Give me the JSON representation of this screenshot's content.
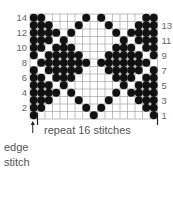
{
  "chart_data": {
    "type": "heatmap",
    "columns": 17,
    "rows": 14,
    "edge_stitch_columns": [
      1
    ],
    "repeat_stitches": 16,
    "cell_meaning": {
      "1": "contrast color (dot)",
      "0": "main color (empty)"
    },
    "grid_rows_top_to_bottom": [
      {
        "row": 14,
        "cells": [
          1,
          1,
          0,
          0,
          0,
          0,
          0,
          1,
          0,
          1,
          0,
          0,
          0,
          0,
          0,
          1,
          1
        ]
      },
      {
        "row": 13,
        "cells": [
          1,
          1,
          1,
          0,
          0,
          0,
          1,
          0,
          0,
          0,
          1,
          0,
          0,
          0,
          1,
          1,
          1
        ]
      },
      {
        "row": 12,
        "cells": [
          1,
          1,
          1,
          1,
          0,
          1,
          0,
          0,
          0,
          0,
          0,
          1,
          0,
          1,
          1,
          1,
          1
        ]
      },
      {
        "row": 11,
        "cells": [
          1,
          1,
          1,
          0,
          1,
          0,
          0,
          0,
          0,
          0,
          0,
          0,
          1,
          0,
          1,
          1,
          1
        ]
      },
      {
        "row": 10,
        "cells": [
          1,
          1,
          0,
          1,
          1,
          1,
          0,
          0,
          0,
          0,
          0,
          1,
          1,
          1,
          0,
          1,
          1
        ]
      },
      {
        "row": 9,
        "cells": [
          1,
          0,
          1,
          1,
          1,
          1,
          1,
          0,
          0,
          0,
          1,
          1,
          1,
          1,
          1,
          0,
          1
        ]
      },
      {
        "row": 8,
        "cells": [
          0,
          1,
          1,
          1,
          1,
          1,
          1,
          1,
          0,
          1,
          1,
          1,
          1,
          1,
          1,
          1,
          0
        ]
      },
      {
        "row": 7,
        "cells": [
          1,
          0,
          1,
          1,
          1,
          1,
          1,
          0,
          0,
          0,
          1,
          1,
          1,
          1,
          1,
          0,
          1
        ]
      },
      {
        "row": 6,
        "cells": [
          1,
          1,
          0,
          1,
          1,
          1,
          0,
          0,
          0,
          0,
          0,
          1,
          1,
          1,
          0,
          1,
          1
        ]
      },
      {
        "row": 5,
        "cells": [
          1,
          1,
          1,
          0,
          1,
          0,
          0,
          0,
          0,
          0,
          0,
          0,
          1,
          0,
          1,
          1,
          1
        ]
      },
      {
        "row": 4,
        "cells": [
          1,
          1,
          1,
          1,
          0,
          1,
          0,
          0,
          0,
          0,
          0,
          1,
          0,
          1,
          1,
          1,
          1
        ]
      },
      {
        "row": 3,
        "cells": [
          1,
          1,
          1,
          0,
          0,
          0,
          1,
          0,
          0,
          0,
          1,
          0,
          0,
          0,
          1,
          1,
          1
        ]
      },
      {
        "row": 2,
        "cells": [
          1,
          1,
          0,
          0,
          0,
          0,
          0,
          1,
          0,
          1,
          0,
          0,
          0,
          0,
          0,
          1,
          1
        ]
      },
      {
        "row": 1,
        "cells": [
          1,
          0,
          0,
          0,
          0,
          0,
          0,
          0,
          1,
          0,
          0,
          0,
          0,
          0,
          0,
          0,
          1
        ]
      }
    ],
    "left_row_labels": [
      "14",
      "12",
      "10",
      "8",
      "6",
      "4",
      "2"
    ],
    "right_row_labels": [
      "13",
      "11",
      "9",
      "7",
      "5",
      "3",
      "1"
    ],
    "repeat_label": "repeat 16 stitches",
    "edge_label_line1": "edge",
    "edge_label_line2": "stitch",
    "colors": {
      "dot": "#111111",
      "grid": "#999999",
      "background": "#ffffff"
    }
  }
}
